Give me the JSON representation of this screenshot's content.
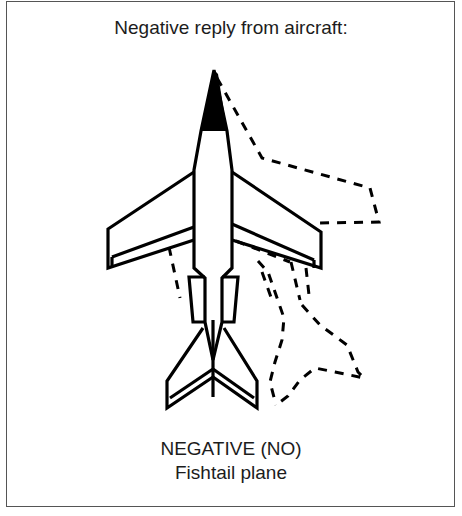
{
  "diagram": {
    "title": "Negative reply from aircraft:",
    "caption": {
      "line1": "NEGATIVE (NO)",
      "line2": "Fishtail plane"
    },
    "figure": {
      "subject": "aircraft-top-view",
      "nose_color": "#000000",
      "outline_color": "#000000",
      "motion_indicator": "dashed-outline-offset-right",
      "frame_color": "#555555"
    }
  }
}
